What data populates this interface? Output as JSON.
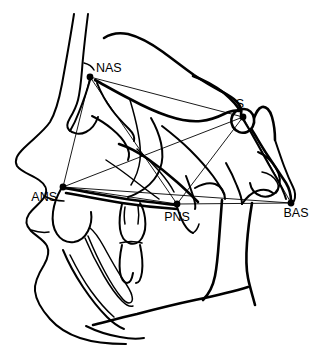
{
  "figure": {
    "type": "cephalometric-tracing",
    "width": 317,
    "height": 361,
    "background_color": "#ffffff",
    "line_color": "#000000"
  },
  "landmarks": [
    {
      "id": "nas",
      "label": "NAS",
      "full_name": "Nasion",
      "point": {
        "x": 90,
        "y": 77
      },
      "label_pos": {
        "x": 96,
        "y": 72
      },
      "anchor": "start"
    },
    {
      "id": "s",
      "label": "S",
      "full_name": "Sella",
      "point": {
        "x": 243,
        "y": 117
      },
      "label_pos": {
        "x": 240,
        "y": 108
      },
      "anchor": "middle"
    },
    {
      "id": "ans",
      "label": "ANS",
      "full_name": "Anterior Nasal Spine",
      "point": {
        "x": 63,
        "y": 187
      },
      "label_pos": {
        "x": 57,
        "y": 201
      },
      "anchor": "end"
    },
    {
      "id": "pns",
      "label": "PNS",
      "full_name": "Posterior Nasal Spine",
      "point": {
        "x": 177,
        "y": 204
      },
      "label_pos": {
        "x": 177,
        "y": 221
      },
      "anchor": "middle"
    },
    {
      "id": "bas",
      "label": "BAS",
      "full_name": "Basion",
      "point": {
        "x": 291,
        "y": 203
      },
      "label_pos": {
        "x": 296,
        "y": 217
      },
      "anchor": "middle"
    }
  ],
  "measurement_lines": [
    {
      "id": "nas-s",
      "from": "nas",
      "to": "s"
    },
    {
      "id": "nas-ans",
      "from": "nas",
      "to": "ans"
    },
    {
      "id": "nas-pns",
      "from": "nas",
      "to": "pns"
    },
    {
      "id": "ans-s",
      "from": "ans",
      "to": "s"
    },
    {
      "id": "ans-pns",
      "from": "ans",
      "to": "pns"
    },
    {
      "id": "ans-bas",
      "from": "ans",
      "to": "bas"
    },
    {
      "id": "pns-s",
      "from": "pns",
      "to": "s"
    },
    {
      "id": "pns-bas",
      "from": "pns",
      "to": "bas"
    },
    {
      "id": "s-bas",
      "from": "s",
      "to": "bas"
    }
  ],
  "anatomy_paths": [
    {
      "id": "soft-tissue-profile",
      "name": "soft-tissue-facial-profile",
      "width": "med",
      "d": "M74,14 C70,40 66,62 62,84 C59,100 56,112 50,122 C44,131 33,139 24,148 C17,155 14,160 17,166 C21,172 32,175 39,180 C45,184 48,190 45,196 C41,203 33,208 29,214 C25,220 26,226 31,231 C36,236 44,240 47,246 C50,252 48,258 44,265 C39,273 34,282 35,291 C36,301 42,310 50,319 C58,328 68,334 80,338 C95,343 110,344 126,344"
    },
    {
      "id": "forehead-inner",
      "name": "forehead-inner-table",
      "width": "med",
      "d": "M88,14 C85,38 83,56 82,70 C81,82 80,92 78,100 C76,108 73,113 70,118 C67,123 66,127 69,130 C73,134 80,135 86,132 C92,129 96,123 98,117"
    },
    {
      "id": "cranial-base-outer",
      "name": "cranial-base-outer-contour",
      "width": "thick",
      "d": "M104,38 C110,34 118,32 128,34 C140,37 152,44 163,52 C174,60 184,68 194,75 C203,81 211,86 219,90 C226,94 232,97 236,101 C240,105 242,110 241,114"
    },
    {
      "id": "anterior-cranial-floor",
      "name": "anterior-cranial-fossa-floor",
      "width": "thick",
      "d": "M95,80 C106,86 118,93 130,99 C143,106 156,112 168,116 C180,120 191,122 201,121 C210,120 218,117 224,114 C230,111 235,110 239,111"
    },
    {
      "id": "orbit-roof",
      "name": "orbital-roof",
      "width": "med",
      "d": "M97,83 C101,93 106,102 112,110 C118,118 124,124 129,129 C133,133 135,137 134,141"
    },
    {
      "id": "orbit-floor",
      "name": "orbital-floor-rim",
      "width": "med",
      "d": "M92,116 C98,119 105,123 112,129 C118,134 123,139 126,145 C129,150 130,155 128,160"
    },
    {
      "id": "orbit-lat",
      "name": "lateral-orbital-wall",
      "width": "thin",
      "d": "M130,100 C133,110 136,121 138,132 C140,142 141,151 140,160 C139,169 136,177 131,185"
    },
    {
      "id": "pterygo",
      "name": "pterygomaxillary-fissure",
      "width": "med",
      "d": "M151,118 C155,125 159,134 161,143 C163,152 163,161 160,169 C157,177 151,184 144,189 C138,193 132,196 128,197"
    },
    {
      "id": "zygomatic",
      "name": "zygomatic-arch",
      "width": "thick",
      "d": "M119,144 C128,147 138,152 148,159 C158,166 168,174 177,182 C185,189 192,196 198,202"
    },
    {
      "id": "maxilla-post",
      "name": "posterior-maxilla-contour",
      "width": "med",
      "d": "M162,126 C171,133 181,141 190,150 C199,159 207,168 213,176 C218,183 222,189 224,194"
    },
    {
      "id": "sella-outline",
      "name": "sella-turcica-outline",
      "width": "thick",
      "d": "M235,112 C231,116 230,122 233,127 C236,132 242,134 247,132 C252,130 255,124 254,118 C253,113 249,109 244,109 C240,109 237,110 235,112 Z"
    },
    {
      "id": "clinoid-post",
      "name": "posterior-clinoid-process",
      "width": "thick",
      "d": "M254,118 C256,113 258,108 262,107 C266,106 270,110 272,117 C274,124 275,132 275,140"
    },
    {
      "id": "clivus",
      "name": "clivus",
      "width": "thick",
      "d": "M252,130 C257,138 262,147 268,156 C274,165 280,174 286,183 C289,188 291,194 291,201"
    },
    {
      "id": "occipital",
      "name": "occipital-contour",
      "width": "med",
      "d": "M275,140 C278,149 281,158 284,166 C287,174 290,181 293,187 C295,191 296,196 294,201"
    },
    {
      "id": "cranial-post",
      "name": "posterior-cranial-outline",
      "width": "med",
      "d": "M241,116 C246,124 252,134 258,145 C264,156 270,167 276,177 C280,184 284,192 286,199"
    },
    {
      "id": "nasal-floor",
      "name": "nasal-floor-palate",
      "width": "thick",
      "d": "M64,188 C82,191 101,195 120,198 C139,201 158,203 176,205"
    },
    {
      "id": "hard-palate",
      "name": "hard-palate-inferior",
      "width": "thick",
      "d": "M66,193 C84,196 103,200 122,203 C141,206 160,208 177,209"
    },
    {
      "id": "maxillary-alveolus",
      "name": "maxillary-alveolar-process",
      "width": "med",
      "d": "M61,189 C57,196 54,204 53,212 C52,220 53,228 57,234 C61,240 67,243 74,242 C80,241 85,237 88,231 C91,225 92,218 91,212"
    },
    {
      "id": "upper-incisor",
      "name": "upper-central-incisor",
      "width": "med",
      "d": "M122,204 C120,212 119,221 120,229 C121,236 124,241 129,243 C134,245 139,243 142,238 C145,233 146,226 145,218 C144,211 142,206 140,203"
    },
    {
      "id": "upper-incisor-tip",
      "name": "upper-incisor-detail",
      "width": "thin",
      "d": "M125,207 C124,213 124,219 125,224 M138,206 C139,212 139,218 138,224"
    },
    {
      "id": "lower-incisor",
      "name": "lower-central-incisor",
      "width": "med",
      "d": "M122,245 C120,254 119,264 120,272 C121,279 124,283 127,283 C130,283 132,279 133,273 M140,245 C142,254 143,264 142,272 C141,279 139,283 136,283"
    },
    {
      "id": "lower-incisor-crown",
      "name": "lower-incisor-crown",
      "width": "thin",
      "d": "M120,243 C127,241 135,241 142,243"
    },
    {
      "id": "mandible-ramus",
      "name": "mandibular-ramus-posterior",
      "width": "thick",
      "d": "M252,203 C250,215 248,229 247,243 C246,256 246,268 248,278 C250,288 253,297 255,305"
    },
    {
      "id": "mandible-body",
      "name": "mandibular-body-inferior",
      "width": "thick",
      "d": "M248,287 C232,292 214,296 195,300 C176,304 156,309 137,314 C120,318 105,322 93,325"
    },
    {
      "id": "mandible-symphysis",
      "name": "mandibular-symphysis",
      "width": "med",
      "d": "M63,250 C68,262 75,275 83,287 C91,299 99,309 107,317 C113,323 119,327 124,329"
    },
    {
      "id": "mandible-inner",
      "name": "mandibular-inner-cortex",
      "width": "thin",
      "d": "M70,255 C76,267 83,280 91,291 C99,302 107,311 114,317"
    },
    {
      "id": "mandibular-canal",
      "name": "mandibular-canal",
      "width": "thin",
      "d": "M88,236 C93,248 99,261 105,272 C111,283 116,291 121,297 C124,301 127,303 129,303 C132,303 133,300 132,296 C131,291 127,285 122,278 C116,269 110,258 104,247 C99,238 94,231 90,228"
    },
    {
      "id": "mandibular-canal2",
      "name": "mandibular-canal-outer",
      "width": "thin",
      "d": "M85,238 C90,250 97,264 104,276 C111,288 117,296 122,301 C126,305 130,307 133,306"
    },
    {
      "id": "chin-contour",
      "name": "chin-soft-contour",
      "width": "med",
      "d": "M86,326 C96,331 108,335 120,337 C130,339 138,339 144,338"
    },
    {
      "id": "lip-upper",
      "name": "upper-lip-contour",
      "width": "thin",
      "d": "M44,196 C50,199 57,201 64,201"
    },
    {
      "id": "lip-lower",
      "name": "lower-lip-contour",
      "width": "thin",
      "d": "M31,230 C37,232 43,233 49,232"
    },
    {
      "id": "soft-palate",
      "name": "soft-palate",
      "width": "med",
      "d": "M177,207 C179,213 181,219 184,224 C187,229 190,232 193,233"
    },
    {
      "id": "pharyngeal-wall",
      "name": "posterior-pharyngeal-wall",
      "width": "thick",
      "d": "M222,200 C221,212 220,226 219,240 C218,254 217,266 215,276 C213,286 209,294 203,300"
    },
    {
      "id": "vomer",
      "name": "vomer-nasal-septum",
      "width": "thin",
      "d": "M106,160 C115,166 125,173 135,181 C144,188 152,194 159,199"
    },
    {
      "id": "tonsil-node",
      "name": "adenoid-outline",
      "width": "med",
      "d": "M195,188 C202,184 209,182 215,184 C221,186 225,192 225,199"
    },
    {
      "id": "condyle",
      "name": "mandibular-condyle",
      "width": "med",
      "d": "M258,152 C265,155 272,161 276,168 C280,175 281,183 278,189 C275,195 268,198 261,196 C255,194 251,189 250,183"
    },
    {
      "id": "coronoid",
      "name": "coronoid-process",
      "width": "med",
      "d": "M226,163 C230,170 234,178 237,186 C240,193 242,199 242,204"
    },
    {
      "id": "sigmoid",
      "name": "sigmoid-notch",
      "width": "med",
      "d": "M242,204 C246,198 251,193 257,191 C263,189 269,190 273,193"
    },
    {
      "id": "ear-canal",
      "name": "external-auditory-meatus",
      "width": "thin",
      "d": "M262,172 C268,173 274,177 277,182 C279,186 279,190 276,193"
    },
    {
      "id": "cranial-top-rear",
      "name": "posterior-skull-top",
      "width": "thick",
      "d": "M193,76 C204,80 215,86 224,93 C231,99 237,105 240,111"
    },
    {
      "id": "nasal-bone",
      "name": "nasal-bone",
      "width": "med",
      "d": "M90,80 C87,91 83,102 79,112 C76,120 73,126 70,131"
    },
    {
      "id": "frontal-sinus",
      "name": "frontal-sinus",
      "width": "thin",
      "d": "M84,63 C88,64 92,66 94,70"
    },
    {
      "id": "pterygoid-plate",
      "name": "pterygoid-plate",
      "width": "med",
      "d": "M186,176 C189,184 192,192 194,199 C195,203 196,206 195,209"
    },
    {
      "id": "max-sinus-post",
      "name": "maxillary-sinus-posterior",
      "width": "thin",
      "d": "M137,149 C145,156 153,164 160,172 C166,179 171,186 174,192"
    },
    {
      "id": "soft-palate-tip",
      "name": "soft-palate-tip",
      "width": "thin",
      "d": "M193,233 C196,231 198,228 199,224"
    }
  ]
}
